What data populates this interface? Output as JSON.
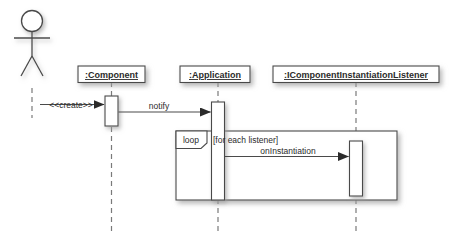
{
  "diagram": {
    "type": "uml-sequence-diagram",
    "background_color": "#ffffff",
    "stroke_color": "#4a4a4a",
    "box_fill": "#ffffff",
    "text_color": "#2b2b2b",
    "shadow_color": "#bdbdbd"
  },
  "actor": {
    "name": "actor",
    "label": ""
  },
  "lifelines": [
    {
      "id": "component",
      "label": ":Component"
    },
    {
      "id": "application",
      "label": ":Application"
    },
    {
      "id": "listener",
      "label": ":IComponentInstantiationListener"
    }
  ],
  "messages": [
    {
      "id": "create",
      "label": "<<create>>",
      "from": "actor",
      "to": "component",
      "arrow": "filled"
    },
    {
      "id": "notify",
      "label": "notify",
      "from": "component",
      "to": "application",
      "arrow": "filled"
    },
    {
      "id": "oninstantiation",
      "label": "onInstantiation",
      "from": "application",
      "to": "listener",
      "arrow": "filled"
    }
  ],
  "fragments": [
    {
      "id": "loop-fragment",
      "kind": "loop",
      "guard": "[for each listener]"
    }
  ]
}
